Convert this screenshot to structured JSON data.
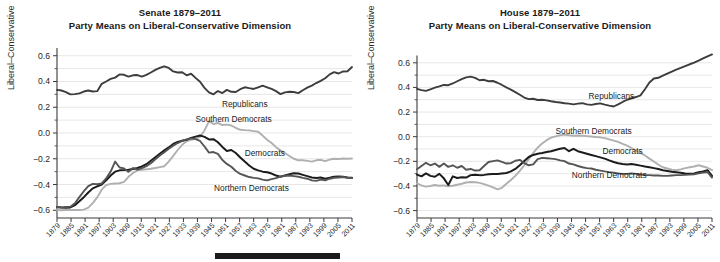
{
  "figure": {
    "background": "#ffffff",
    "marker_bar": {
      "name": "redaction-bar",
      "color": "#1b1b1b"
    }
  },
  "panels": [
    {
      "id": "senate",
      "title_line1": "Senate 1879–2011",
      "title_line2": "Party Means on Liberal-Conservative Dimension",
      "ylabel": "Liberal–Conservative",
      "labels": [
        {
          "name": "Republicans",
          "x": 1963,
          "y": 0.205
        },
        {
          "name": "Southern Democrats",
          "x": 1958,
          "y": 0.083
        },
        {
          "name": "Democrats",
          "x": 1972,
          "y": -0.175
        },
        {
          "name": "Northern Democrats",
          "x": 1966,
          "y": -0.447
        }
      ]
    },
    {
      "id": "house",
      "title_line1": "House 1879–2011",
      "title_line2": "Party Means on Liberal-Conservative Dimension",
      "ylabel": "Liberal–Conservative",
      "labels": [
        {
          "name": "Republicans",
          "x": 1966,
          "y": 0.305
        },
        {
          "name": "Southern Democrats",
          "x": 1958,
          "y": 0.022
        },
        {
          "name": "Democrats",
          "x": 1971,
          "y": -0.142
        },
        {
          "name": "Northern Democrats",
          "x": 1965,
          "y": -0.338
        }
      ]
    }
  ],
  "chart_data": [
    {
      "type": "line",
      "panel": "senate",
      "title": "Senate 1879–2011 — Party Means on Liberal-Conservative Dimension",
      "xlabel": "",
      "ylabel": "Liberal–Conservative",
      "xlim": [
        1879,
        2011
      ],
      "ylim": [
        -0.66,
        0.66
      ],
      "yticks": [
        0.6,
        0.4,
        0.2,
        0.0,
        -0.2,
        -0.4,
        -0.6
      ],
      "ytick_labels": [
        "0.6",
        "0.4",
        "0.2",
        "0.0",
        "−0.2",
        "−0.4",
        "−0.6"
      ],
      "xticks": [
        1879,
        1885,
        1891,
        1897,
        1903,
        1909,
        1915,
        1921,
        1927,
        1933,
        1939,
        1945,
        1951,
        1957,
        1963,
        1975,
        1981,
        1987,
        1993,
        1999,
        2005,
        2011
      ],
      "xtick_labels": [
        "1879",
        "1885",
        "1891",
        "1897",
        "1903",
        "1909",
        "1915",
        "1921",
        "1927",
        "1933",
        "1939",
        "1945",
        "1951",
        "1957",
        "1963",
        "1975",
        "1981",
        "1987",
        "1993",
        "1999",
        "2005",
        "2011"
      ],
      "grid": true,
      "legend_position": "inline-annotation",
      "x": [
        1879,
        1881,
        1883,
        1885,
        1887,
        1889,
        1891,
        1893,
        1895,
        1897,
        1899,
        1901,
        1903,
        1905,
        1907,
        1909,
        1911,
        1913,
        1915,
        1917,
        1919,
        1921,
        1923,
        1925,
        1927,
        1929,
        1931,
        1933,
        1935,
        1937,
        1939,
        1941,
        1943,
        1945,
        1947,
        1949,
        1951,
        1953,
        1955,
        1957,
        1959,
        1961,
        1963,
        1965,
        1967,
        1969,
        1971,
        1973,
        1975,
        1977,
        1979,
        1981,
        1983,
        1985,
        1987,
        1989,
        1991,
        1993,
        1995,
        1997,
        1999,
        2001,
        2003,
        2005,
        2007,
        2009,
        2011
      ],
      "series": [
        {
          "name": "Republicans",
          "color": "#3d3d3d",
          "width": 1.9,
          "values": [
            0.335,
            0.33,
            0.318,
            0.3,
            0.302,
            0.308,
            0.322,
            0.33,
            0.322,
            0.325,
            0.382,
            0.4,
            0.42,
            0.43,
            0.455,
            0.452,
            0.438,
            0.448,
            0.45,
            0.438,
            0.452,
            0.47,
            0.49,
            0.505,
            0.518,
            0.505,
            0.478,
            0.47,
            0.472,
            0.448,
            0.46,
            0.428,
            0.398,
            0.35,
            0.315,
            0.3,
            0.326,
            0.31,
            0.335,
            0.32,
            0.318,
            0.34,
            0.355,
            0.348,
            0.342,
            0.355,
            0.368,
            0.355,
            0.342,
            0.325,
            0.302,
            0.315,
            0.32,
            0.318,
            0.31,
            0.332,
            0.352,
            0.368,
            0.388,
            0.405,
            0.425,
            0.455,
            0.472,
            0.462,
            0.478,
            0.48,
            0.512,
            0.56,
            0.59
          ]
        },
        {
          "name": "Southern Democrats",
          "color": "#b0b0b0",
          "width": 1.9,
          "values": [
            -0.598,
            -0.6,
            -0.598,
            -0.598,
            -0.598,
            -0.598,
            -0.595,
            -0.58,
            -0.545,
            -0.5,
            -0.44,
            -0.405,
            -0.395,
            -0.392,
            -0.39,
            -0.38,
            -0.34,
            -0.31,
            -0.29,
            -0.285,
            -0.282,
            -0.278,
            -0.272,
            -0.265,
            -0.258,
            -0.222,
            -0.178,
            -0.132,
            -0.092,
            -0.065,
            -0.052,
            -0.045,
            -0.03,
            0.02,
            0.09,
            0.07,
            0.078,
            0.062,
            0.065,
            0.058,
            0.04,
            0.025,
            0.022,
            0.02,
            0.015,
            0.01,
            -0.02,
            -0.052,
            -0.078,
            -0.11,
            -0.135,
            -0.155,
            -0.178,
            -0.2,
            -0.212,
            -0.212,
            -0.216,
            -0.222,
            -0.212,
            -0.208,
            -0.218,
            -0.206,
            -0.2,
            -0.202,
            -0.198,
            -0.2,
            -0.198
          ]
        },
        {
          "name": "Democrats",
          "color": "#1c1c1c",
          "width": 2.0,
          "values": [
            -0.575,
            -0.578,
            -0.58,
            -0.578,
            -0.56,
            -0.53,
            -0.498,
            -0.462,
            -0.43,
            -0.415,
            -0.4,
            -0.368,
            -0.33,
            -0.3,
            -0.29,
            -0.288,
            -0.285,
            -0.28,
            -0.272,
            -0.26,
            -0.242,
            -0.215,
            -0.188,
            -0.162,
            -0.135,
            -0.112,
            -0.085,
            -0.07,
            -0.06,
            -0.052,
            -0.038,
            -0.028,
            -0.02,
            -0.03,
            -0.05,
            -0.048,
            -0.072,
            -0.108,
            -0.14,
            -0.132,
            -0.155,
            -0.19,
            -0.222,
            -0.252,
            -0.278,
            -0.29,
            -0.3,
            -0.305,
            -0.315,
            -0.33,
            -0.34,
            -0.33,
            -0.32,
            -0.312,
            -0.315,
            -0.325,
            -0.335,
            -0.345,
            -0.35,
            -0.345,
            -0.355,
            -0.348,
            -0.34,
            -0.338,
            -0.34,
            -0.345,
            -0.348
          ]
        },
        {
          "name": "Northern Democrats",
          "color": "#555555",
          "width": 1.9,
          "values": [
            -0.575,
            -0.578,
            -0.575,
            -0.572,
            -0.545,
            -0.498,
            -0.452,
            -0.412,
            -0.395,
            -0.398,
            -0.392,
            -0.352,
            -0.3,
            -0.222,
            -0.268,
            -0.275,
            -0.302,
            -0.272,
            -0.285,
            -0.272,
            -0.258,
            -0.235,
            -0.205,
            -0.175,
            -0.15,
            -0.122,
            -0.098,
            -0.078,
            -0.062,
            -0.05,
            -0.042,
            -0.048,
            -0.062,
            -0.105,
            -0.152,
            -0.148,
            -0.162,
            -0.21,
            -0.24,
            -0.262,
            -0.295,
            -0.318,
            -0.33,
            -0.342,
            -0.348,
            -0.352,
            -0.362,
            -0.368,
            -0.358,
            -0.35,
            -0.338,
            -0.332,
            -0.33,
            -0.335,
            -0.34,
            -0.348,
            -0.355,
            -0.368,
            -0.372,
            -0.362,
            -0.368,
            -0.355,
            -0.348,
            -0.345,
            -0.342,
            -0.348,
            -0.35
          ]
        }
      ]
    },
    {
      "type": "line",
      "panel": "house",
      "title": "House 1879–2011 — Party Means on Liberal-Conservative Dimension",
      "xlabel": "",
      "ylabel": "Liberal–Conservative",
      "xlim": [
        1879,
        2011
      ],
      "ylim": [
        -0.66,
        0.72
      ],
      "yticks": [
        0.6,
        0.4,
        0.2,
        0.0,
        -0.2,
        -0.4,
        -0.6
      ],
      "ytick_labels": [
        "0.6",
        "0.4",
        "0.2",
        "0.0",
        "−0.2",
        "−0.4",
        "−0.6"
      ],
      "xticks": [
        1879,
        1885,
        1891,
        1897,
        1903,
        1909,
        1915,
        1921,
        1927,
        1933,
        1939,
        1945,
        1951,
        1957,
        1963,
        1975,
        1981,
        1987,
        1993,
        1999,
        2005,
        2011
      ],
      "xtick_labels": [
        "1879",
        "1885",
        "1891",
        "1897",
        "1903",
        "1909",
        "1915",
        "1921",
        "1927",
        "1933",
        "1939",
        "1945",
        "1951",
        "1957",
        "1963",
        "1975",
        "1981",
        "1987",
        "1993",
        "1999",
        "2005",
        "2011"
      ],
      "grid": true,
      "legend_position": "inline-annotation",
      "x": [
        1879,
        1881,
        1883,
        1885,
        1887,
        1889,
        1891,
        1893,
        1895,
        1897,
        1899,
        1901,
        1903,
        1905,
        1907,
        1909,
        1911,
        1913,
        1915,
        1917,
        1919,
        1921,
        1923,
        1925,
        1927,
        1929,
        1931,
        1933,
        1935,
        1937,
        1939,
        1941,
        1943,
        1945,
        1947,
        1949,
        1951,
        1953,
        1955,
        1957,
        1959,
        1961,
        1963,
        1965,
        1967,
        1969,
        1971,
        1973,
        1975,
        1977,
        1979,
        1981,
        1983,
        1985,
        1987,
        1989,
        1991,
        1993,
        1995,
        1997,
        1999,
        2001,
        2003,
        2005,
        2007,
        2009,
        2011
      ],
      "series": [
        {
          "name": "Republicans",
          "color": "#3d3d3d",
          "width": 1.9,
          "values": [
            0.388,
            0.378,
            0.372,
            0.385,
            0.398,
            0.408,
            0.42,
            0.418,
            0.432,
            0.45,
            0.468,
            0.482,
            0.488,
            0.478,
            0.458,
            0.462,
            0.45,
            0.452,
            0.438,
            0.42,
            0.4,
            0.382,
            0.362,
            0.34,
            0.318,
            0.305,
            0.308,
            0.298,
            0.3,
            0.295,
            0.288,
            0.282,
            0.278,
            0.272,
            0.268,
            0.262,
            0.268,
            0.272,
            0.262,
            0.258,
            0.265,
            0.27,
            0.26,
            0.252,
            0.245,
            0.262,
            0.282,
            0.3,
            0.312,
            0.322,
            0.335,
            0.385,
            0.44,
            0.472,
            0.478,
            0.495,
            0.512,
            0.528,
            0.545,
            0.558,
            0.572,
            0.588,
            0.602,
            0.618,
            0.635,
            0.652,
            0.668
          ]
        },
        {
          "name": "Southern Democrats",
          "color": "#b0b0b0",
          "width": 1.9,
          "values": [
            -0.378,
            -0.395,
            -0.405,
            -0.4,
            -0.392,
            -0.398,
            -0.395,
            -0.402,
            -0.398,
            -0.39,
            -0.382,
            -0.372,
            -0.368,
            -0.37,
            -0.375,
            -0.385,
            -0.398,
            -0.412,
            -0.428,
            -0.415,
            -0.382,
            -0.352,
            -0.318,
            -0.278,
            -0.232,
            -0.182,
            -0.132,
            -0.088,
            -0.055,
            -0.028,
            -0.008,
            0.002,
            0.012,
            0.018,
            0.012,
            0.008,
            0.01,
            0.008,
            0.005,
            0.002,
            -0.002,
            -0.005,
            -0.012,
            -0.022,
            -0.032,
            -0.042,
            -0.058,
            -0.072,
            -0.092,
            -0.112,
            -0.132,
            -0.152,
            -0.178,
            -0.202,
            -0.228,
            -0.248,
            -0.258,
            -0.268,
            -0.272,
            -0.265,
            -0.255,
            -0.248,
            -0.242,
            -0.232,
            -0.242,
            -0.252,
            -0.272
          ]
        },
        {
          "name": "Democrats",
          "color": "#1c1c1c",
          "width": 2.0,
          "values": [
            -0.308,
            -0.322,
            -0.298,
            -0.318,
            -0.325,
            -0.302,
            -0.338,
            -0.392,
            -0.322,
            -0.335,
            -0.33,
            -0.332,
            -0.312,
            -0.308,
            -0.312,
            -0.31,
            -0.305,
            -0.302,
            -0.302,
            -0.298,
            -0.295,
            -0.282,
            -0.262,
            -0.232,
            -0.198,
            -0.165,
            -0.148,
            -0.138,
            -0.132,
            -0.125,
            -0.118,
            -0.108,
            -0.098,
            -0.092,
            -0.118,
            -0.098,
            -0.118,
            -0.128,
            -0.138,
            -0.148,
            -0.158,
            -0.168,
            -0.178,
            -0.192,
            -0.205,
            -0.215,
            -0.222,
            -0.225,
            -0.222,
            -0.228,
            -0.235,
            -0.242,
            -0.248,
            -0.255,
            -0.262,
            -0.272,
            -0.278,
            -0.285,
            -0.288,
            -0.292,
            -0.298,
            -0.3,
            -0.298,
            -0.288,
            -0.282,
            -0.272,
            -0.318
          ]
        },
        {
          "name": "Northern Democrats",
          "color": "#555555",
          "width": 1.9,
          "values": [
            -0.265,
            -0.238,
            -0.212,
            -0.232,
            -0.218,
            -0.245,
            -0.218,
            -0.245,
            -0.232,
            -0.252,
            -0.238,
            -0.268,
            -0.262,
            -0.275,
            -0.272,
            -0.238,
            -0.205,
            -0.198,
            -0.192,
            -0.205,
            -0.218,
            -0.215,
            -0.195,
            -0.188,
            -0.215,
            -0.232,
            -0.225,
            -0.182,
            -0.172,
            -0.175,
            -0.178,
            -0.182,
            -0.192,
            -0.198,
            -0.218,
            -0.225,
            -0.238,
            -0.248,
            -0.255,
            -0.258,
            -0.268,
            -0.275,
            -0.282,
            -0.288,
            -0.292,
            -0.298,
            -0.302,
            -0.302,
            -0.298,
            -0.302,
            -0.308,
            -0.312,
            -0.312,
            -0.315,
            -0.315,
            -0.318,
            -0.318,
            -0.315,
            -0.312,
            -0.312,
            -0.31,
            -0.308,
            -0.305,
            -0.298,
            -0.292,
            -0.288,
            -0.332
          ]
        }
      ]
    }
  ]
}
